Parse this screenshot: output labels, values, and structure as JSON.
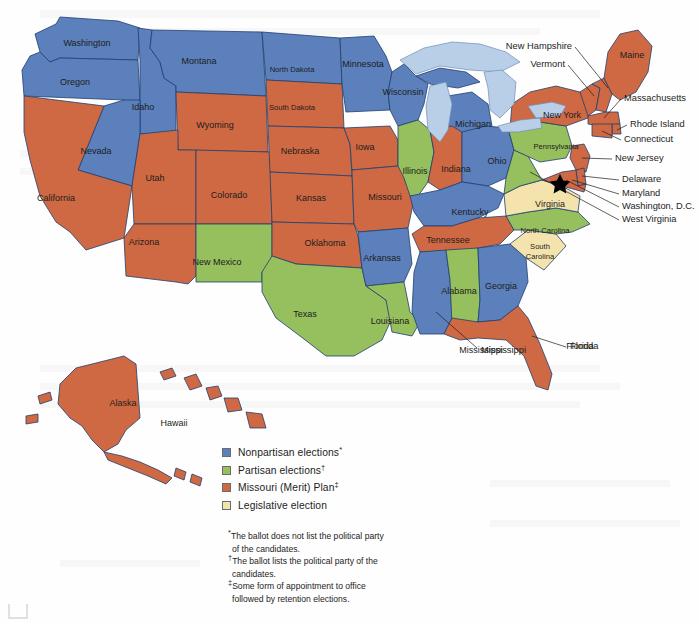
{
  "figure": {
    "kind": "map"
  },
  "colors": {
    "nonpartisan_blue": "#5b80bc",
    "partisan_green": "#96bf5e",
    "merit_orange": "#cf6944",
    "legislative_yellow": "#f5e3ad",
    "lake_blue": "#b9cfe8",
    "border_stroke": "#1f3f6e",
    "text": "#1d1d1b"
  },
  "legend": {
    "items": [
      {
        "label": "Nonpartisan elections",
        "mark": "*",
        "color_key": "nonpartisan_blue",
        "color": "#5b80bc"
      },
      {
        "label": "Partisan elections",
        "mark": "†",
        "color_key": "partisan_green",
        "color": "#96bf5e"
      },
      {
        "label": "Missouri (Merit) Plan",
        "mark": "‡",
        "color_key": "merit_orange",
        "color": "#cf6944"
      },
      {
        "label": "Legislative election",
        "mark": "",
        "color_key": "legislative_yellow",
        "color": "#f5e3ad"
      }
    ]
  },
  "footnotes": [
    {
      "mark": "*",
      "line1": "The ballot does not list the political party",
      "line2": "of the candidates."
    },
    {
      "mark": "†",
      "line1": "The ballot lists the political party of the",
      "line2": "candidates."
    },
    {
      "mark": "‡",
      "line1": "Some form of appointment to office",
      "line2": "followed by retention elections."
    }
  ],
  "states": [
    {
      "name": "Washington",
      "category": "nonpartisan",
      "label_x": 87,
      "label_y": 44
    },
    {
      "name": "Oregon",
      "category": "nonpartisan",
      "label_x": 75,
      "label_y": 83
    },
    {
      "name": "Idaho",
      "category": "nonpartisan",
      "label_x": 143,
      "label_y": 108
    },
    {
      "name": "Montana",
      "category": "nonpartisan",
      "label_x": 199,
      "label_y": 62
    },
    {
      "name": "Wyoming",
      "category": "merit",
      "label_x": 215,
      "label_y": 126
    },
    {
      "name": "Nevada",
      "category": "nonpartisan",
      "label_x": 96,
      "label_y": 152
    },
    {
      "name": "California",
      "category": "merit",
      "label_x": 56,
      "label_y": 199
    },
    {
      "name": "Utah",
      "category": "merit",
      "label_x": 155,
      "label_y": 179
    },
    {
      "name": "Colorado",
      "category": "merit",
      "label_x": 229,
      "label_y": 196
    },
    {
      "name": "Arizona",
      "category": "merit",
      "label_x": 144,
      "label_y": 243
    },
    {
      "name": "New Mexico",
      "category": "partisan",
      "label_x": 217,
      "label_y": 263
    },
    {
      "name": "North Dakota",
      "category": "nonpartisan",
      "label_x": 292,
      "label_y": 70
    },
    {
      "name": "South Dakota",
      "category": "merit",
      "label_x": 292,
      "label_y": 108
    },
    {
      "name": "Nebraska",
      "category": "merit",
      "label_x": 300,
      "label_y": 152
    },
    {
      "name": "Kansas",
      "category": "merit",
      "label_x": 311,
      "label_y": 199
    },
    {
      "name": "Oklahoma",
      "category": "merit",
      "label_x": 325,
      "label_y": 244
    },
    {
      "name": "Texas",
      "category": "partisan",
      "label_x": 305,
      "label_y": 315
    },
    {
      "name": "Minnesota",
      "category": "nonpartisan",
      "label_x": 363,
      "label_y": 65
    },
    {
      "name": "Iowa",
      "category": "merit",
      "label_x": 365,
      "label_y": 148
    },
    {
      "name": "Missouri",
      "category": "merit",
      "label_x": 385,
      "label_y": 198
    },
    {
      "name": "Arkansas",
      "category": "nonpartisan",
      "label_x": 382,
      "label_y": 259
    },
    {
      "name": "Louisiana",
      "category": "partisan",
      "label_x": 390,
      "label_y": 322
    },
    {
      "name": "Wisconsin",
      "category": "nonpartisan",
      "label_x": 403,
      "label_y": 93
    },
    {
      "name": "Illinois",
      "category": "partisan",
      "label_x": 415,
      "label_y": 172
    },
    {
      "name": "Michigan",
      "category": "nonpartisan",
      "label_x": 473,
      "label_y": 125
    },
    {
      "name": "Indiana",
      "category": "merit",
      "label_x": 456,
      "label_y": 170
    },
    {
      "name": "Ohio",
      "category": "nonpartisan",
      "label_x": 497,
      "label_y": 162
    },
    {
      "name": "Kentucky",
      "category": "nonpartisan",
      "label_x": 470,
      "label_y": 213
    },
    {
      "name": "Tennessee",
      "category": "merit",
      "label_x": 448,
      "label_y": 241
    },
    {
      "name": "Mississippi",
      "category": "nonpartisan",
      "label_x": 481,
      "label_y": 351
    },
    {
      "name": "Alabama",
      "category": "partisan",
      "label_x": 459,
      "label_y": 292
    },
    {
      "name": "Georgia",
      "category": "nonpartisan",
      "label_x": 501,
      "label_y": 287
    },
    {
      "name": "Florida",
      "category": "merit",
      "label_x": 580,
      "label_y": 347
    },
    {
      "name": "South Carolina",
      "category": "legislative",
      "label_x": 540,
      "label_y": 252
    },
    {
      "name": "North Carolina",
      "category": "partisan",
      "label_x": 545,
      "label_y": 231
    },
    {
      "name": "Virginia",
      "category": "legislative",
      "label_x": 550,
      "label_y": 205
    },
    {
      "name": "West Virginia",
      "category": "partisan",
      "label_x": 0,
      "label_y": 0
    },
    {
      "name": "Pennsylvania",
      "category": "partisan",
      "label_x": 556,
      "label_y": 147
    },
    {
      "name": "New York",
      "category": "merit",
      "label_x": 562,
      "label_y": 116
    },
    {
      "name": "Maine",
      "category": "merit",
      "label_x": 632,
      "label_y": 56
    },
    {
      "name": "Alaska",
      "category": "merit",
      "label_x": 123,
      "label_y": 404
    },
    {
      "name": "Hawaii",
      "category": "merit",
      "label_x": 174,
      "label_y": 424
    }
  ],
  "callouts": [
    {
      "name": "New Hampshire",
      "x": 572,
      "y": 47,
      "align": "end"
    },
    {
      "name": "Vermont",
      "x": 565,
      "y": 65,
      "align": "end"
    },
    {
      "name": "Massachusetts",
      "x": 624,
      "y": 99,
      "align": "start"
    },
    {
      "name": "Rhode Island",
      "x": 630,
      "y": 125,
      "align": "start"
    },
    {
      "name": "Connecticut",
      "x": 624,
      "y": 140,
      "align": "start"
    },
    {
      "name": "New Jersey",
      "x": 615,
      "y": 159,
      "align": "start"
    },
    {
      "name": "Delaware",
      "x": 622,
      "y": 180,
      "align": "start"
    },
    {
      "name": "Maryland",
      "x": 622,
      "y": 194,
      "align": "start"
    },
    {
      "name": "Washington, D.C.",
      "x": 622,
      "y": 207,
      "align": "start"
    },
    {
      "name": "West Virginia",
      "x": 622,
      "y": 220,
      "align": "start"
    },
    {
      "name": "Florida",
      "x": 570,
      "y": 347,
      "align": "start"
    },
    {
      "name": "Mississippi",
      "x": 481,
      "y": 351,
      "align": "start"
    }
  ]
}
